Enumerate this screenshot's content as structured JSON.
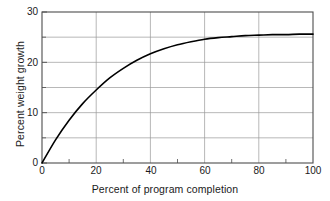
{
  "chart_data": {
    "type": "line",
    "title": "",
    "subtitle": "",
    "xlabel": "Percent of program completion",
    "ylabel": "Percent weight growth",
    "xlim": [
      0,
      100
    ],
    "ylim": [
      0,
      30
    ],
    "xticks": [
      0,
      20,
      40,
      60,
      80,
      100
    ],
    "yticks": [
      0,
      10,
      20,
      30
    ],
    "x_minor_ticks": [
      10,
      30,
      50,
      70,
      90
    ],
    "y_minor_ticks": [
      5,
      15,
      25
    ],
    "grid": true,
    "grid_x": [
      20,
      40,
      60,
      80
    ],
    "grid_y": [
      5,
      10,
      15,
      20,
      25
    ],
    "legend": "none",
    "line_color": "#000000",
    "line_width": 1.6,
    "grid_color": "#9a9a9a",
    "axis_color": "#4d4d4d",
    "series": [
      {
        "name": "Percent weight growth",
        "x": [
          0,
          5,
          10,
          15,
          20,
          25,
          30,
          35,
          40,
          45,
          50,
          55,
          60,
          65,
          70,
          75,
          80,
          85,
          90,
          95,
          100
        ],
        "values": [
          0,
          4.6,
          8.5,
          11.8,
          14.5,
          16.9,
          18.8,
          20.4,
          21.7,
          22.7,
          23.5,
          24.1,
          24.6,
          24.9,
          25.1,
          25.3,
          25.4,
          25.5,
          25.5,
          25.6,
          25.6
        ]
      }
    ],
    "xtick_labels": [
      "0",
      "20",
      "40",
      "60",
      "80",
      "100"
    ],
    "ytick_labels": [
      "0",
      "10",
      "20",
      "30"
    ]
  },
  "axis": {
    "x_title": "Percent of program completion",
    "y_title": "Percent weight growth"
  }
}
